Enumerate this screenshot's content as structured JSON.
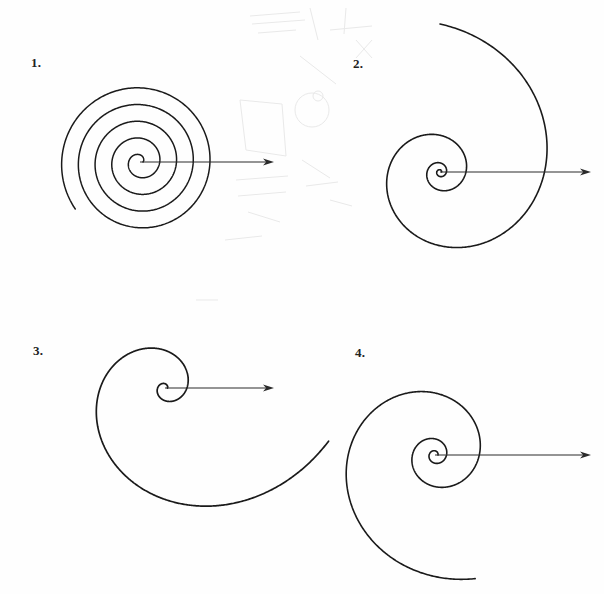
{
  "page": {
    "width": 604,
    "height": 594,
    "background_color": "#fefefe",
    "ink_color": "#1a1a1a",
    "label_color": "#222222"
  },
  "chart_data": {
    "type": "line",
    "title": "",
    "xlabel": "",
    "ylabel": "",
    "grid": false,
    "legend_position": "none",
    "panels": [
      {
        "label": "1.",
        "label_x": 31,
        "label_y": 56,
        "spiral_kind": "archimedean",
        "center_x": 140,
        "center_y": 162,
        "r_start": 3,
        "r_end": 80,
        "turns": 4.6,
        "start_angle_deg": 0,
        "direction": "counterclockwise",
        "stroke_width": 1.5,
        "arrow": {
          "from_x": 140,
          "from_y": 162,
          "to_x": 274,
          "to_y": 162,
          "head_length": 11,
          "head_width": 7,
          "stroke_width": 1.1
        }
      },
      {
        "label": "2.",
        "label_x": 353,
        "label_y": 57,
        "spiral_kind": "logarithmic",
        "center_x": 440,
        "center_y": 172,
        "r_start": 1.6,
        "r_end": 148,
        "turns": 3.25,
        "start_angle_deg": 0,
        "direction": "counterclockwise",
        "stroke_width": 1.6,
        "arrow": {
          "from_x": 440,
          "from_y": 172,
          "to_x": 591,
          "to_y": 172,
          "head_length": 11,
          "head_width": 7,
          "stroke_width": 1.1
        }
      },
      {
        "label": "3.",
        "label_x": 33,
        "label_y": 344,
        "spiral_kind": "logarithmic",
        "center_x": 165,
        "center_y": 388,
        "r_start": 2.5,
        "r_end": 172,
        "turns": 1.95,
        "start_angle_deg": 0,
        "direction": "counterclockwise",
        "stroke_width": 1.7,
        "arrow": {
          "from_x": 165,
          "from_y": 388,
          "to_x": 274,
          "to_y": 388,
          "head_length": 11,
          "head_width": 7,
          "stroke_width": 1.1
        }
      },
      {
        "label": "4.",
        "label_x": 355,
        "label_y": 346,
        "spiral_kind": "logarithmic",
        "center_x": 435,
        "center_y": 455,
        "r_start": 3,
        "r_end": 130,
        "turns": 2.8,
        "start_angle_deg": 0,
        "direction": "counterclockwise",
        "stroke_width": 1.6,
        "arrow": {
          "from_x": 435,
          "from_y": 455,
          "to_x": 591,
          "to_y": 455,
          "head_length": 11,
          "head_width": 7,
          "stroke_width": 1.1
        }
      }
    ]
  },
  "ghost_marks": {
    "note": "Very faint grey pencil show-through from the reverse side of the scanned sheet.",
    "color": "#e9e9e9",
    "shapes": [
      {
        "kind": "line",
        "x1": 250,
        "y1": 16,
        "x2": 300,
        "y2": 12
      },
      {
        "kind": "line",
        "x1": 252,
        "y1": 24,
        "x2": 305,
        "y2": 20
      },
      {
        "kind": "line",
        "x1": 258,
        "y1": 33,
        "x2": 296,
        "y2": 30
      },
      {
        "kind": "line",
        "x1": 310,
        "y1": 8,
        "x2": 318,
        "y2": 40
      },
      {
        "kind": "line",
        "x1": 330,
        "y1": 30,
        "x2": 372,
        "y2": 26
      },
      {
        "kind": "line",
        "x1": 346,
        "y1": 8,
        "x2": 344,
        "y2": 34
      },
      {
        "kind": "line",
        "x1": 356,
        "y1": 40,
        "x2": 372,
        "y2": 58
      },
      {
        "kind": "line",
        "x1": 372,
        "y1": 40,
        "x2": 356,
        "y2": 58
      },
      {
        "kind": "circle",
        "cx": 312,
        "cy": 110,
        "r": 17
      },
      {
        "kind": "line",
        "x1": 240,
        "y1": 100,
        "x2": 246,
        "y2": 150
      },
      {
        "kind": "line",
        "x1": 246,
        "y1": 150,
        "x2": 286,
        "y2": 156
      },
      {
        "kind": "line",
        "x1": 286,
        "y1": 156,
        "x2": 282,
        "y2": 104
      },
      {
        "kind": "line",
        "x1": 282,
        "y1": 104,
        "x2": 240,
        "y2": 100
      },
      {
        "kind": "line",
        "x1": 236,
        "y1": 180,
        "x2": 288,
        "y2": 176
      },
      {
        "kind": "line",
        "x1": 238,
        "y1": 196,
        "x2": 286,
        "y2": 192
      },
      {
        "kind": "line",
        "x1": 248,
        "y1": 212,
        "x2": 280,
        "y2": 222
      },
      {
        "kind": "circle",
        "cx": 318,
        "cy": 96,
        "r": 5
      },
      {
        "kind": "line",
        "x1": 302,
        "y1": 160,
        "x2": 330,
        "y2": 178
      },
      {
        "kind": "line",
        "x1": 306,
        "y1": 186,
        "x2": 338,
        "y2": 182
      },
      {
        "kind": "line",
        "x1": 330,
        "y1": 200,
        "x2": 352,
        "y2": 206
      },
      {
        "kind": "line",
        "x1": 225,
        "y1": 240,
        "x2": 262,
        "y2": 236
      },
      {
        "kind": "line",
        "x1": 300,
        "y1": 56,
        "x2": 336,
        "y2": 84
      },
      {
        "kind": "line",
        "x1": 196,
        "y1": 300,
        "x2": 218,
        "y2": 300
      }
    ]
  }
}
